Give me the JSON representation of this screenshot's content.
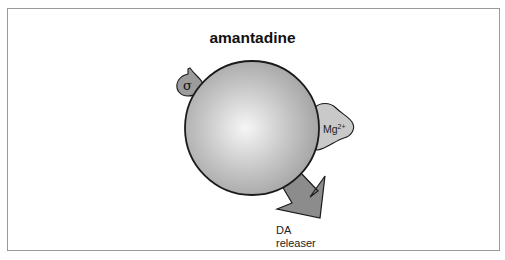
{
  "title": "amantadine",
  "labels": {
    "sigma_symbol": "σ",
    "mg_base": "Mg",
    "mg_charge": "2+",
    "arrow_label_line1": "DA",
    "arrow_label_line2": "releaser"
  },
  "colors": {
    "border": "#9a9a9a",
    "sphere_light": "#f4f4f4",
    "sphere_dark": "#9a9a9a",
    "mg_blob": "#c9c9c9",
    "sigma_blob": "#9c9c9c",
    "arrow": "#8c8c8c",
    "outline": "#1a1a1a"
  }
}
